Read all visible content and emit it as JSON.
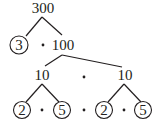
{
  "diagram": {
    "type": "factor-tree",
    "colors": {
      "ink": "#231f20",
      "background": "#ffffff"
    },
    "root": {
      "label": "300"
    },
    "level1": {
      "prime": "3",
      "composite": "100",
      "operator": "·"
    },
    "level2": {
      "left": "10",
      "right": "10",
      "operator": "·"
    },
    "level3": {
      "left_pair": {
        "a": "2",
        "b": "5",
        "operator": "·"
      },
      "right_pair": {
        "a": "2",
        "b": "5",
        "operator": "·"
      },
      "between_operator": "·"
    },
    "prime_factors": [
      "3",
      "2",
      "5",
      "2",
      "5"
    ]
  }
}
